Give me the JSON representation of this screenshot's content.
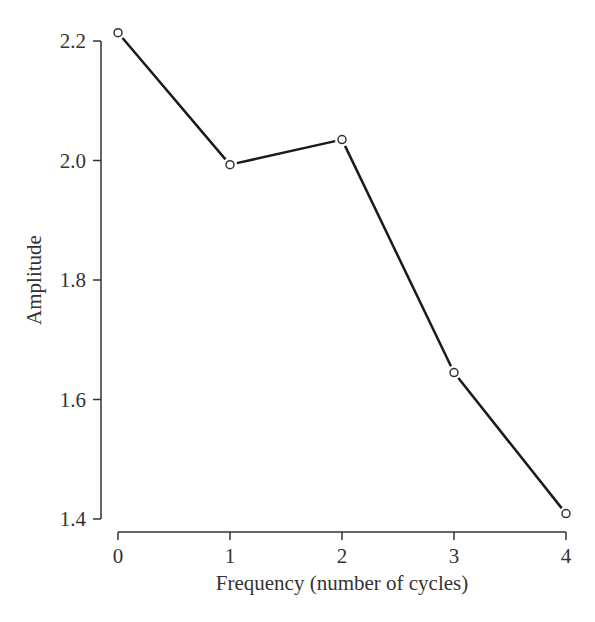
{
  "chart_data": {
    "type": "line",
    "title": "",
    "xlabel": "Frequency (number of cycles)",
    "ylabel": "Amplitude",
    "x": [
      0,
      1,
      2,
      3,
      4
    ],
    "series": [
      {
        "name": "Amplitude",
        "values": [
          2.214,
          1.993,
          2.035,
          1.645,
          1.409
        ]
      }
    ],
    "xticks": [
      "0",
      "1",
      "2",
      "3",
      "4"
    ],
    "yticks": [
      "1.4",
      "1.6",
      "1.8",
      "2.0",
      "2.2"
    ],
    "xlim": [
      0,
      4
    ],
    "ylim": [
      1.4,
      2.2
    ],
    "grid": false,
    "legend": null,
    "marker": "open-circle",
    "line_color": "#1a1a1a"
  }
}
